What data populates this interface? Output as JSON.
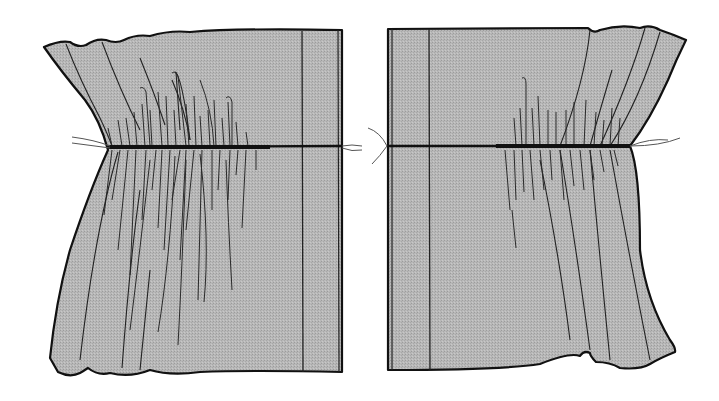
{
  "figure": {
    "colors": {
      "fabric": "#b4b4b4",
      "outline": "#111111",
      "thread": "#1a1a1a",
      "loose_thread": "#6a6a6a",
      "background": "#ffffff"
    },
    "panels": [
      {
        "id": "left-panel",
        "side": "left",
        "gather_side": "left"
      },
      {
        "id": "right-panel",
        "side": "right",
        "gather_side": "right"
      }
    ]
  }
}
